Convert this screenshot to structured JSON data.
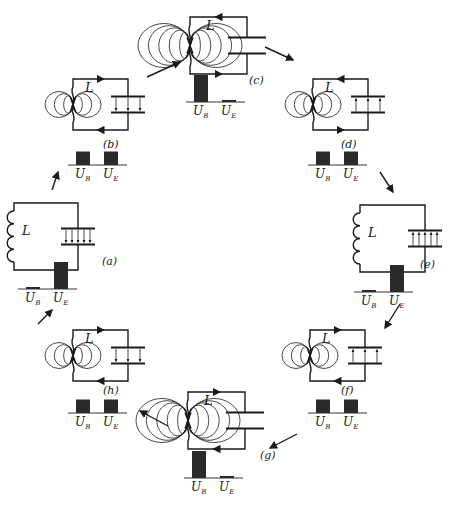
{
  "inductor_label": "L",
  "energy_labels": {
    "magnetic": "U_B",
    "electric": "U_E",
    "magnetic_main": "U",
    "magnetic_sub": "B",
    "electric_main": "U",
    "electric_sub": "E"
  },
  "stages": [
    {
      "id": "a",
      "label": "(a)",
      "U_B": 0.05,
      "U_E": 1.0,
      "capacitor_field": "down",
      "current": "none"
    },
    {
      "id": "b",
      "label": "(b)",
      "U_B": 0.5,
      "U_E": 0.5,
      "capacitor_field": "down",
      "current": "clockwise"
    },
    {
      "id": "c",
      "label": "(c)",
      "U_B": 1.0,
      "U_E": 0.05,
      "capacitor_field": "none",
      "current": "counterclockwise-top-left"
    },
    {
      "id": "d",
      "label": "(d)",
      "U_B": 0.5,
      "U_E": 0.5,
      "capacitor_field": "up",
      "current": "counterclockwise"
    },
    {
      "id": "e",
      "label": "(e)",
      "U_B": 0.05,
      "U_E": 1.0,
      "capacitor_field": "up",
      "current": "none"
    },
    {
      "id": "f",
      "label": "(f)",
      "U_B": 0.5,
      "U_E": 0.5,
      "capacitor_field": "up",
      "current": "clockwise"
    },
    {
      "id": "g",
      "label": "(g)",
      "U_B": 1.0,
      "U_E": 0.05,
      "capacitor_field": "none",
      "current": "clockwise"
    },
    {
      "id": "h",
      "label": "(h)",
      "U_B": 0.5,
      "U_E": 0.5,
      "capacitor_field": "down",
      "current": "clockwise"
    }
  ],
  "cycle_order": [
    "a",
    "b",
    "c",
    "d",
    "e",
    "f",
    "g",
    "h"
  ]
}
